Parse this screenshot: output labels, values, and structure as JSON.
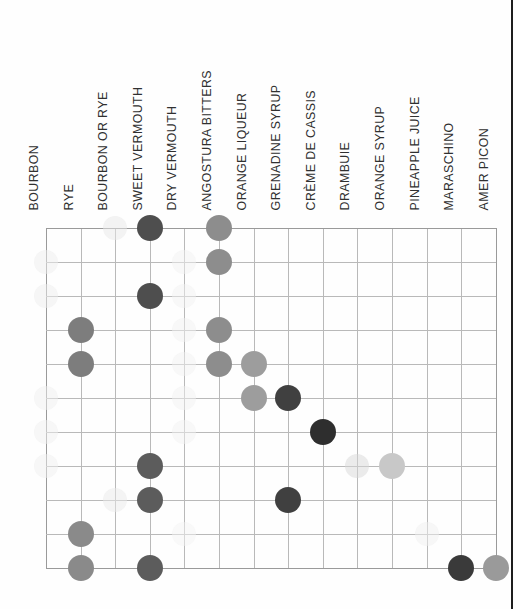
{
  "chart_data": {
    "type": "heatmap",
    "title": "",
    "xlabel": "",
    "ylabel": "",
    "grid": true,
    "legend": "none",
    "columns": [
      "BOURBON",
      "RYE",
      "BOURBON OR RYE",
      "SWEET VERMOUTH",
      "DRY VERMOUTH",
      "ANGOSTURA BITTERS",
      "ORANGE LIQUEUR",
      "GRENADINE SYRUP",
      "CRÈME DE CASSIS",
      "DRAMBUIE",
      "ORANGE SYRUP",
      "PINEAPPLE JUICE",
      "MARASCHINO",
      "AMER PICON"
    ],
    "rows": [
      "1",
      "2",
      "3",
      "4",
      "5",
      "6",
      "7",
      "8",
      "9",
      "10",
      "11"
    ],
    "cells": [
      {
        "row": 0,
        "col": 2,
        "shade": "#e8e8e8",
        "size": "md"
      },
      {
        "row": 0,
        "col": 3,
        "shade": "#4e4e4e",
        "size": "lg"
      },
      {
        "row": 0,
        "col": 5,
        "shade": "#8d8d8d",
        "size": "lg"
      },
      {
        "row": 1,
        "col": 0,
        "shade": "#ededed",
        "size": "md"
      },
      {
        "row": 1,
        "col": 4,
        "shade": "#f2f2f2",
        "size": "md"
      },
      {
        "row": 1,
        "col": 5,
        "shade": "#8d8d8d",
        "size": "lg"
      },
      {
        "row": 2,
        "col": 0,
        "shade": "#ededed",
        "size": "md"
      },
      {
        "row": 2,
        "col": 3,
        "shade": "#4e4e4e",
        "size": "lg"
      },
      {
        "row": 2,
        "col": 4,
        "shade": "#f2f2f2",
        "size": "md"
      },
      {
        "row": 3,
        "col": 1,
        "shade": "#7d7d7d",
        "size": "lg"
      },
      {
        "row": 3,
        "col": 4,
        "shade": "#f2f2f2",
        "size": "md"
      },
      {
        "row": 3,
        "col": 5,
        "shade": "#8d8d8d",
        "size": "lg"
      },
      {
        "row": 4,
        "col": 1,
        "shade": "#7d7d7d",
        "size": "lg"
      },
      {
        "row": 4,
        "col": 4,
        "shade": "#f2f2f2",
        "size": "md"
      },
      {
        "row": 4,
        "col": 5,
        "shade": "#8d8d8d",
        "size": "lg"
      },
      {
        "row": 4,
        "col": 6,
        "shade": "#9d9d9d",
        "size": "lg"
      },
      {
        "row": 5,
        "col": 0,
        "shade": "#f0f0f0",
        "size": "md"
      },
      {
        "row": 5,
        "col": 4,
        "shade": "#f2f2f2",
        "size": "md"
      },
      {
        "row": 5,
        "col": 6,
        "shade": "#9d9d9d",
        "size": "lg"
      },
      {
        "row": 5,
        "col": 7,
        "shade": "#404040",
        "size": "lg"
      },
      {
        "row": 6,
        "col": 0,
        "shade": "#f0f0f0",
        "size": "md"
      },
      {
        "row": 6,
        "col": 4,
        "shade": "#f2f2f2",
        "size": "md"
      },
      {
        "row": 6,
        "col": 8,
        "shade": "#2e2e2e",
        "size": "lg"
      },
      {
        "row": 7,
        "col": 0,
        "shade": "#f0f0f0",
        "size": "md"
      },
      {
        "row": 7,
        "col": 3,
        "shade": "#5c5c5c",
        "size": "lg"
      },
      {
        "row": 7,
        "col": 9,
        "shade": "#d8d8d8",
        "size": "lg"
      },
      {
        "row": 7,
        "col": 10,
        "shade": "#c8c8c8",
        "size": "lg"
      },
      {
        "row": 8,
        "col": 2,
        "shade": "#eaeaea",
        "size": "md"
      },
      {
        "row": 8,
        "col": 3,
        "shade": "#5c5c5c",
        "size": "lg"
      },
      {
        "row": 8,
        "col": 7,
        "shade": "#404040",
        "size": "lg"
      },
      {
        "row": 9,
        "col": 1,
        "shade": "#8a8a8a",
        "size": "lg"
      },
      {
        "row": 9,
        "col": 4,
        "shade": "#f4f4f4",
        "size": "md"
      },
      {
        "row": 9,
        "col": 11,
        "shade": "#f0f0f0",
        "size": "md"
      },
      {
        "row": 10,
        "col": 1,
        "shade": "#8a8a8a",
        "size": "lg"
      },
      {
        "row": 10,
        "col": 3,
        "shade": "#5c5c5c",
        "size": "lg"
      },
      {
        "row": 10,
        "col": 12,
        "shade": "#3a3a3a",
        "size": "lg"
      },
      {
        "row": 10,
        "col": 13,
        "shade": "#9a9a9a",
        "size": "lg"
      }
    ]
  },
  "geometry": {
    "grid_left": 46,
    "grid_top": 228,
    "col_step": 34.6,
    "row_step": 34.0,
    "n_cols": 13,
    "n_rows": 10
  },
  "colors": {
    "gridline": "#b9b9b9",
    "page_edge": "#1d1d1d",
    "label_text": "#303030",
    "background": "#fefefe"
  }
}
